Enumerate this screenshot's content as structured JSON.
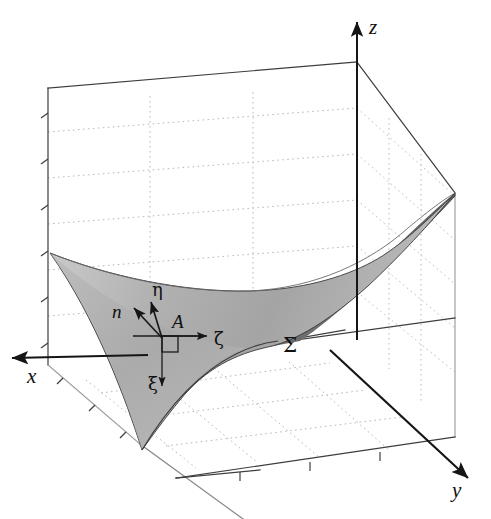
{
  "figure": {
    "background_color": "#ffffff",
    "line_color": "#2b2b2b",
    "grid_color": "#b9b9b9"
  },
  "axes": {
    "x": {
      "label": "x",
      "label_x": 27,
      "label_y": 383,
      "direction": "left"
    },
    "y": {
      "label": "y",
      "label_x": 452,
      "label_y": 497,
      "direction": "down-right"
    },
    "z": {
      "label": "z",
      "label_x": 369,
      "label_y": 34,
      "direction": "up"
    }
  },
  "surface": {
    "label": "Σ",
    "label_x": 283,
    "label_y": 352,
    "fill_top_light": "#d3d3d3",
    "fill_top_mid": "#a8a8a8",
    "fill_underside": "#6d6d6d",
    "edge_color": "#3a3a3a"
  },
  "local_frame": {
    "origin_x": 162,
    "origin_y": 336,
    "point_label": "A",
    "point_label_x": 172,
    "point_label_y": 326,
    "right_angle_marker": "square",
    "vectors": [
      {
        "name": "eta",
        "label": "η",
        "label_x": 155,
        "label_y": 297,
        "tip_x": 152,
        "tip_y": 303
      },
      {
        "name": "n",
        "label": "n",
        "label_x": 117,
        "label_y": 317,
        "tip_x": 136,
        "tip_y": 309
      },
      {
        "name": "zeta",
        "label": "ζ",
        "label_x": 216,
        "label_y": 345,
        "tip_x": 205,
        "tip_y": 336
      },
      {
        "name": "xi",
        "label": "ξ",
        "label_x": 151,
        "label_y": 388,
        "tip_x": 167,
        "tip_y": 389
      }
    ]
  },
  "box": {
    "grid_lines_style": "dotted",
    "tick_marks": true,
    "left_wall_ticks": 6,
    "floor_ticks": 4
  }
}
